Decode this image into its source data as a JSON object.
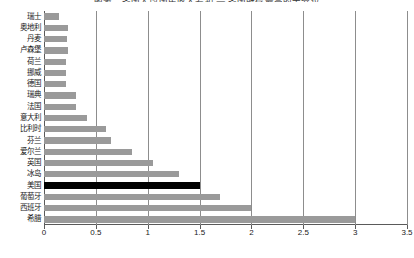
{
  "chart_data": {
    "type": "bar",
    "orientation": "horizontal",
    "title": "图表：各国人均国民收入差距 — 各国所得最高的十分位",
    "xlabel": "",
    "ylabel": "",
    "xlim": [
      0,
      3.5
    ],
    "xticks": [
      "0",
      "0.5",
      "1",
      "1.5",
      "2",
      "2.5",
      "3",
      "3.5"
    ],
    "xtick_values": [
      0,
      0.5,
      1,
      1.5,
      2,
      2.5,
      3,
      3.5
    ],
    "grid": true,
    "legend": "none",
    "categories": [
      "瑞士",
      "奥地利",
      "丹麦",
      "卢森堡",
      "荷兰",
      "挪威",
      "德国",
      "瑞典",
      "法国",
      "意大利",
      "比利时",
      "芬兰",
      "爱尔兰",
      "英国",
      "冰岛",
      "美国",
      "葡萄牙",
      "西班牙",
      "希腊"
    ],
    "values": [
      0.14,
      0.23,
      0.22,
      0.23,
      0.21,
      0.21,
      0.21,
      0.31,
      0.31,
      0.41,
      0.6,
      0.65,
      0.85,
      1.05,
      1.3,
      1.5,
      1.7,
      2.0,
      3.0
    ],
    "highlight_category": "美国",
    "colors": {
      "bar": "#9a9a9a",
      "highlight_bar": "#000000",
      "gridline": "#8d8d8d",
      "axis": "#5a5a5a",
      "background": "#ffffff",
      "text": "#1a1a1a"
    }
  }
}
